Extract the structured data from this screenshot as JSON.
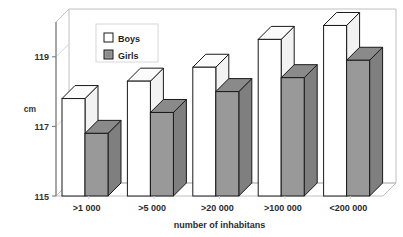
{
  "chart_data": {
    "type": "bar",
    "title": "",
    "subtitle": "",
    "xlabel": "number of inhabitans",
    "ylabel": "cm",
    "categories": [
      ">1 000",
      ">5 000",
      ">20 000",
      ">100 000",
      "<200 000"
    ],
    "series": [
      {
        "name": "Boys",
        "values": [
          117.8,
          118.3,
          118.7,
          119.5,
          119.9
        ],
        "color": "#ffffff"
      },
      {
        "name": "Girls",
        "values": [
          116.8,
          117.4,
          118.0,
          118.4,
          118.9
        ],
        "color": "#999999"
      }
    ],
    "ylim": [
      115,
      120
    ],
    "yticks": [
      115,
      117,
      119
    ],
    "ytick_labels": [
      "115",
      "117",
      "119"
    ],
    "grid": false,
    "legend_position": "top-left-inside",
    "style": "3d-columns"
  },
  "legend": {
    "items": [
      {
        "label": "Boys",
        "swatch": "white-square-icon"
      },
      {
        "label": "Girls",
        "swatch": "gray-square-icon"
      }
    ]
  },
  "axes": {
    "y_unit": "cm",
    "x_title": "number of inhabitans"
  },
  "colors": {
    "boys_face": "#ffffff",
    "boys_side": "#f2f2f2",
    "boys_top": "#fbfbfb",
    "girls_face": "#999999",
    "girls_side": "#7f7f7f",
    "girls_top": "#8a8a8a",
    "outline": "#1a1a1a",
    "frame": "#c0c0c0",
    "axis": "#6e6e6e"
  }
}
